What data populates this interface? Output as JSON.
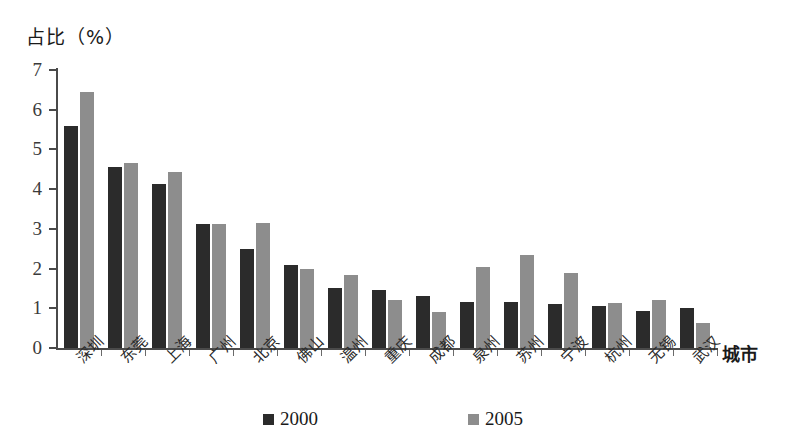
{
  "chart_data": {
    "type": "bar",
    "title": "",
    "ylabel": "占比（%）",
    "xlabel": "城市",
    "ylim": [
      0,
      7
    ],
    "yticks": [
      0,
      1,
      2,
      3,
      4,
      5,
      6,
      7
    ],
    "grid": false,
    "legend_position": "bottom",
    "categories": [
      "深圳",
      "东莞",
      "上海",
      "广州",
      "北京",
      "佛山",
      "温州",
      "重庆",
      "成都",
      "泉州",
      "苏州",
      "宁波",
      "杭州",
      "无锡",
      "武汉"
    ],
    "series": [
      {
        "name": "2000",
        "color": "#2b2b2b",
        "values": [
          5.6,
          4.55,
          4.13,
          3.12,
          2.5,
          2.1,
          1.5,
          1.45,
          1.3,
          1.15,
          1.15,
          1.1,
          1.05,
          0.92,
          1.02
        ]
      },
      {
        "name": "2005",
        "color": "#8d8d8d",
        "values": [
          6.45,
          4.65,
          4.43,
          3.12,
          3.15,
          2.0,
          1.83,
          1.2,
          0.9,
          2.05,
          2.35,
          1.88,
          1.13,
          1.2,
          0.62
        ]
      }
    ]
  }
}
